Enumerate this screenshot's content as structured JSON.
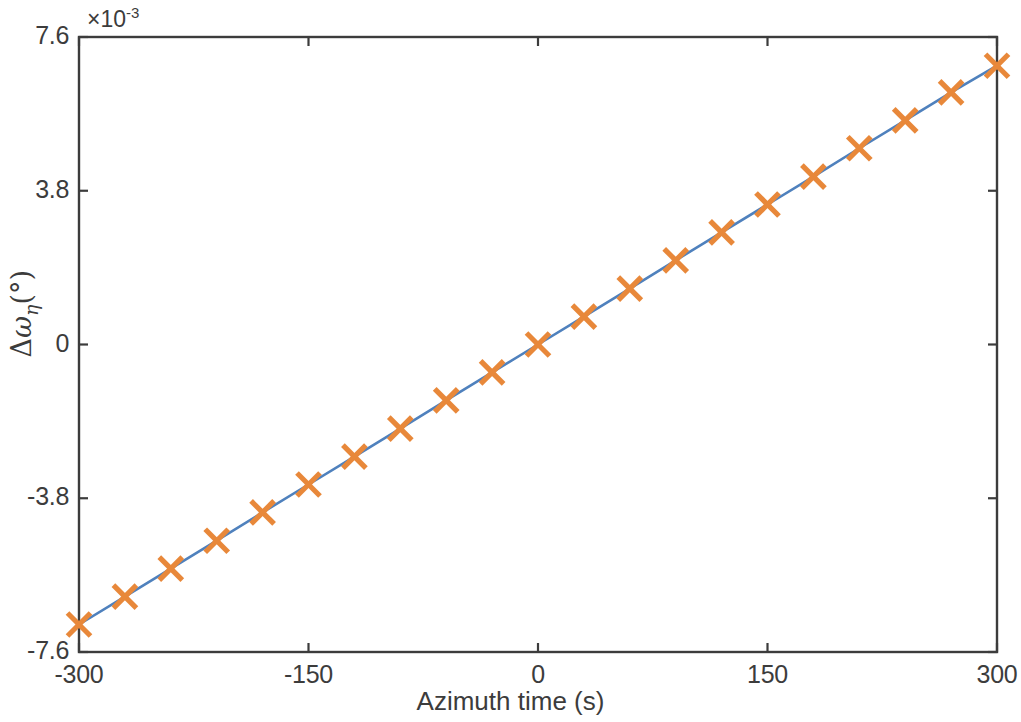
{
  "figure": {
    "background_color": "#ffffff",
    "axis_color": "#3c3c3c",
    "line_color": "#4F81BD",
    "marker_color": "#E8883A",
    "exponent_text": "×10",
    "exponent_power": "-3"
  },
  "labels": {
    "xlabel": "Azimuth time (s)",
    "ylabel_delta": "Δ",
    "ylabel_omega": "ω",
    "ylabel_eta": "η",
    "ylabel_units": "(°)",
    "ylabel_full": "Δωη(°)"
  },
  "chart_data": {
    "type": "line",
    "title": "",
    "xlabel": "Azimuth time (s)",
    "ylabel": "Δωη(°)",
    "y_scale_exponent": -3,
    "xlim": [
      -300,
      300
    ],
    "ylim": [
      -7.6,
      7.6
    ],
    "xticks": [
      -300,
      -150,
      0,
      150,
      300
    ],
    "xticklabels": [
      "-300",
      "-150",
      "0",
      "150",
      "300"
    ],
    "yticks": [
      -7.6,
      -3.8,
      0,
      3.8,
      7.6
    ],
    "yticklabels": [
      "-7.6",
      "-3.8",
      "0",
      "3.8",
      "7.6"
    ],
    "grid": false,
    "legend": null,
    "series": [
      {
        "name": "Δωη",
        "line_color": "#4F81BD",
        "marker": "x",
        "marker_color": "#E8883A",
        "x": [
          -300,
          -270,
          -240,
          -210,
          -180,
          -150,
          -120,
          -90,
          -60,
          -30,
          0,
          30,
          60,
          90,
          120,
          150,
          180,
          210,
          240,
          270,
          300
        ],
        "values": [
          -6.92,
          -6.23,
          -5.54,
          -4.85,
          -4.15,
          -3.46,
          -2.77,
          -2.08,
          -1.38,
          -0.69,
          0.0,
          0.69,
          1.38,
          2.08,
          2.77,
          3.46,
          4.15,
          4.85,
          5.54,
          6.23,
          6.89
        ]
      }
    ]
  }
}
